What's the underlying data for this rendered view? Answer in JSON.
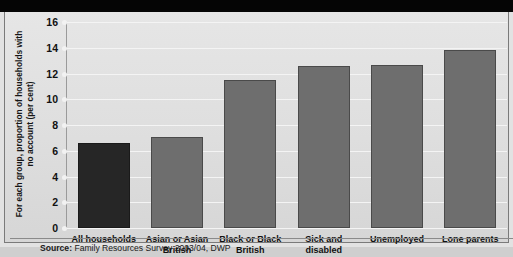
{
  "figure": {
    "background_color": "#e2e2e2",
    "top_band_color": "#050505"
  },
  "source": {
    "label": "Source:",
    "text": " Family Resources Survey 2003/04, DWP"
  },
  "chart_data": {
    "type": "bar",
    "title": "",
    "xlabel": "",
    "ylabel": "For each group, proportion of households with no account (per cent)",
    "categories": [
      "All households",
      "Asian or Asian British",
      "Black or Black British",
      "Sick and disabled",
      "Unemployed",
      "Lone parents"
    ],
    "values": [
      6.6,
      7.1,
      11.5,
      12.6,
      12.7,
      13.8
    ],
    "ylim": [
      0,
      16
    ],
    "yticks": [
      0,
      2,
      4,
      6,
      8,
      10,
      12,
      14,
      16
    ],
    "ytick_labels": [
      "0",
      "2",
      "4",
      "6",
      "8",
      "10",
      "12",
      "14",
      "16"
    ],
    "grid": true,
    "legend": "none",
    "bar_colors": [
      "#262626",
      "#6e6e6e",
      "#6e6e6e",
      "#6e6e6e",
      "#6e6e6e",
      "#6e6e6e"
    ],
    "highlight_index": 0
  }
}
